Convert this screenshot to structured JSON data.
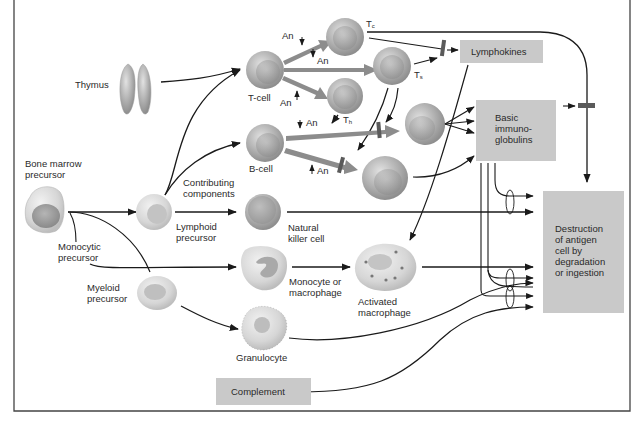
{
  "diagram": {
    "type": "immune system cell lineage and effector pathways",
    "nodes": {
      "thymus": "Thymus",
      "bone_marrow": [
        "Bone marrow",
        "precursor"
      ],
      "monocytic_precursor": [
        "Monocytic",
        "precursor"
      ],
      "myeloid_precursor": [
        "Myeloid",
        "precursor"
      ],
      "lymphoid_precursor": [
        "Lymphoid",
        "precursor"
      ],
      "contributing": [
        "Contributing",
        "components"
      ],
      "t_cell": "T-cell",
      "b_cell": "B-cell",
      "nk_cell": [
        "Natural",
        "killer cell"
      ],
      "monocyte": [
        "Monocyte or",
        "macrophage"
      ],
      "activated_macrophage": [
        "Activated",
        "macrophage"
      ],
      "granulocyte": "Granulocyte",
      "tc": "T",
      "tc_sub": "c",
      "ts": "T",
      "ts_sub": "s",
      "th": "T",
      "th_sub": "h",
      "antigen": "An"
    },
    "boxes": {
      "lymphokines": "Lymphokines",
      "immunoglobulins": [
        "Basic",
        "immuno-",
        "globulins"
      ],
      "destruction": [
        "Destruction",
        "of antigen",
        "cell by",
        "degradation",
        "or ingestion"
      ],
      "complement": "Complement"
    },
    "colors": {
      "box_fill": "#c9c9c9",
      "arrow": "#1a1a1a",
      "thick_arrow": "#8c8c8c",
      "block_bar": "#5a5a5a",
      "cell_fill": "#b8b8b8"
    }
  }
}
